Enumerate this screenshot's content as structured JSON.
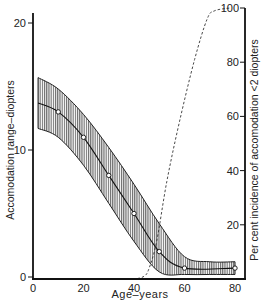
{
  "chart_data": {
    "type": "line",
    "title": "",
    "xlabel": "Age–years",
    "ylabel": "Accomodation range–diopters",
    "y2label": "Per cent incidence of accomodation <2 diopters",
    "xlim": [
      0,
      80
    ],
    "ylim": [
      0,
      20
    ],
    "y2lim": [
      0,
      100
    ],
    "x_ticks": [
      "0",
      "20",
      "40",
      "60",
      "80"
    ],
    "y_ticks": [
      "0",
      "10",
      "20"
    ],
    "y2_ticks": [
      "20",
      "40",
      "60",
      "80",
      "100"
    ],
    "grid": false,
    "legend": null,
    "series": [
      {
        "name": "Mean accomodation range",
        "axis": "left",
        "style": "solid line with open circle markers",
        "x": [
          10,
          20,
          30,
          40,
          50,
          60,
          80
        ],
        "values": [
          13,
          11,
          8,
          5,
          2,
          0.7,
          0.7
        ]
      },
      {
        "name": "Accomodation range spread (hatched band)",
        "axis": "left",
        "style": "hatched band",
        "x": [
          2,
          10,
          20,
          30,
          40,
          50,
          60,
          70,
          80
        ],
        "upper": [
          15.7,
          14.8,
          12.8,
          10.2,
          7.3,
          4.2,
          1.6,
          1.2,
          1.2
        ],
        "lower": [
          11.7,
          11.0,
          8.8,
          5.8,
          2.8,
          0.4,
          0.2,
          0.2,
          0.2
        ]
      },
      {
        "name": "Per cent incidence of accomodation <2 diopters",
        "axis": "right",
        "style": "dashed line",
        "x": [
          40,
          44,
          46,
          49,
          53,
          58,
          64,
          69,
          72,
          78
        ],
        "values": [
          0,
          1,
          4,
          14,
          36,
          58,
          81,
          96,
          99,
          100
        ]
      }
    ]
  },
  "labels": {
    "xlabel": "Age–years",
    "ylabel": "Accomodation range–diopters",
    "y2label": "Per cent incidence of accomodation <2 diopters"
  }
}
